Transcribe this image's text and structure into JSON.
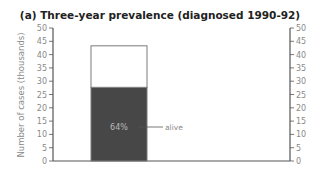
{
  "chart_data": {
    "type": "bar",
    "title": "(a) Three-year prevalence (diagnosed 1990-92)",
    "xlabel": "",
    "ylabel": "Number of cases (thousands)",
    "ylim": [
      0,
      50
    ],
    "yticks": [
      0,
      5,
      10,
      15,
      20,
      25,
      30,
      35,
      40,
      45,
      50
    ],
    "right_axis": true,
    "grid": false,
    "legend": null,
    "categories": [
      ""
    ],
    "stacked": true,
    "series": [
      {
        "name": "alive",
        "values": [
          27.7
        ],
        "color": "#474747"
      },
      {
        "name": "other",
        "values": [
          15.6
        ],
        "color": "#ffffff"
      }
    ],
    "total": [
      43.3
    ],
    "annotations": [
      {
        "text": "64%",
        "target": "alive segment",
        "position": "inside"
      },
      {
        "text": "alive",
        "target": "alive segment",
        "position": "right, with leader line"
      }
    ]
  },
  "colors": {
    "alive_fill": "#474747",
    "bar_outline": "#7a7a7a",
    "axis": "#555555",
    "title": "#222222",
    "tick_text": "#8a8a8a"
  }
}
